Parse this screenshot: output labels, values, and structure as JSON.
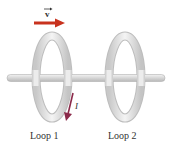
{
  "diagram": {
    "velocity_label": "v",
    "current_label": "I",
    "loops": [
      {
        "label": "Loop 1"
      },
      {
        "label": "Loop 2"
      }
    ],
    "colors": {
      "velocity_arrow": "#c8321e",
      "current_arrow": "#8b2a4a",
      "ring": "#e4e4e4",
      "rod": "#dcdcdc"
    }
  }
}
